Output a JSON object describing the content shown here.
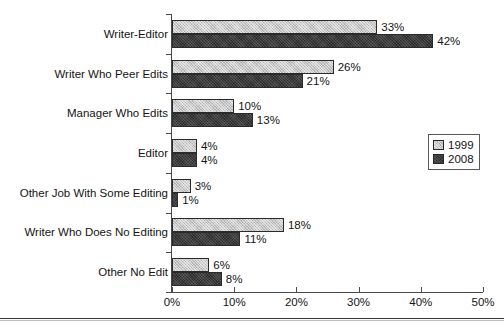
{
  "chart_data": {
    "type": "bar",
    "orientation": "horizontal",
    "title": "",
    "subtitle": "",
    "xlabel": "",
    "ylabel": "",
    "xlim": [
      0,
      50
    ],
    "xticks": [
      "0%",
      "10%",
      "20%",
      "30%",
      "40%",
      "50%"
    ],
    "xtick_values": [
      0,
      10,
      20,
      30,
      40,
      50
    ],
    "grid": false,
    "legend_position": "right-middle",
    "categories": [
      "Writer-Editor",
      "Writer Who Peer Edits",
      "Manager Who Edits",
      "Editor",
      "Other Job With Some Editing",
      "Writer Who Does No Editing",
      "Other No Edit"
    ],
    "series": [
      {
        "name": "1999",
        "color": "#c9c9c9",
        "values": [
          33,
          26,
          10,
          4,
          3,
          18,
          6
        ],
        "labels": [
          "33%",
          "26%",
          "10%",
          "4%",
          "3%",
          "18%",
          "6%"
        ]
      },
      {
        "name": "2008",
        "color": "#3c3c3c",
        "values": [
          42,
          21,
          13,
          4,
          1,
          11,
          8
        ],
        "labels": [
          "42%",
          "21%",
          "13%",
          "4%",
          "1%",
          "11%",
          "8%"
        ]
      }
    ]
  },
  "legend": {
    "items": [
      {
        "label": "1999",
        "swatch": "#c9c9c9"
      },
      {
        "label": "2008",
        "swatch": "#3c3c3c"
      }
    ]
  }
}
